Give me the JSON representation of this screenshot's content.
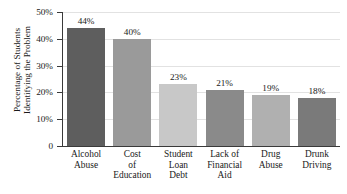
{
  "chart_data": {
    "type": "bar",
    "title": "",
    "xlabel": "",
    "ylabel_line1": "Percentage of Students",
    "ylabel_line2": "Identifying the Problem",
    "categories": [
      "Alcohol Abuse",
      "Cost of Education",
      "Student Loan Debt",
      "Lack of Financial Aid",
      "Drug Abuse",
      "Drunk Driving"
    ],
    "category_lines": [
      [
        "Alcohol",
        "Abuse"
      ],
      [
        "Cost",
        "of",
        "Education"
      ],
      [
        "Student",
        "Loan",
        "Debt"
      ],
      [
        "Lack of",
        "Financial",
        "Aid"
      ],
      [
        "Drug",
        "Abuse"
      ],
      [
        "Drunk",
        "Driving"
      ]
    ],
    "values": [
      44,
      40,
      23,
      21,
      19,
      18
    ],
    "value_labels": [
      "44%",
      "40%",
      "23%",
      "21%",
      "19%",
      "18%"
    ],
    "bar_colors": [
      "#5e5e5e",
      "#9a9a9a",
      "#c8c8c8",
      "#8a8a8a",
      "#b0b0b0",
      "#7a7a7a"
    ],
    "ylim": [
      0,
      50
    ],
    "yticks": [
      0,
      10,
      20,
      30,
      40,
      50
    ],
    "ytick_labels": [
      "0",
      "10%",
      "20%",
      "30%",
      "40%",
      "50%"
    ],
    "grid": true,
    "grid_color": "#e2e2e2",
    "legend": "none",
    "axis_color": "#3a3a3a",
    "background": "#ffffff"
  }
}
